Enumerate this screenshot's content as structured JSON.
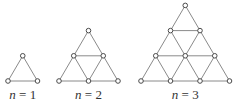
{
  "figure": {
    "colors": {
      "edge": "#8a8a8a",
      "node_stroke": "#4a4a4a",
      "node_fill": "#ffffff",
      "text": "#333333"
    },
    "graphs": [
      {
        "n": 1,
        "label_var": "n",
        "label_eq": " = 1",
        "rows": 2
      },
      {
        "n": 2,
        "label_var": "n",
        "label_eq": " = 2",
        "rows": 3
      },
      {
        "n": 3,
        "label_var": "n",
        "label_eq": " = 3",
        "rows": 4
      }
    ]
  }
}
